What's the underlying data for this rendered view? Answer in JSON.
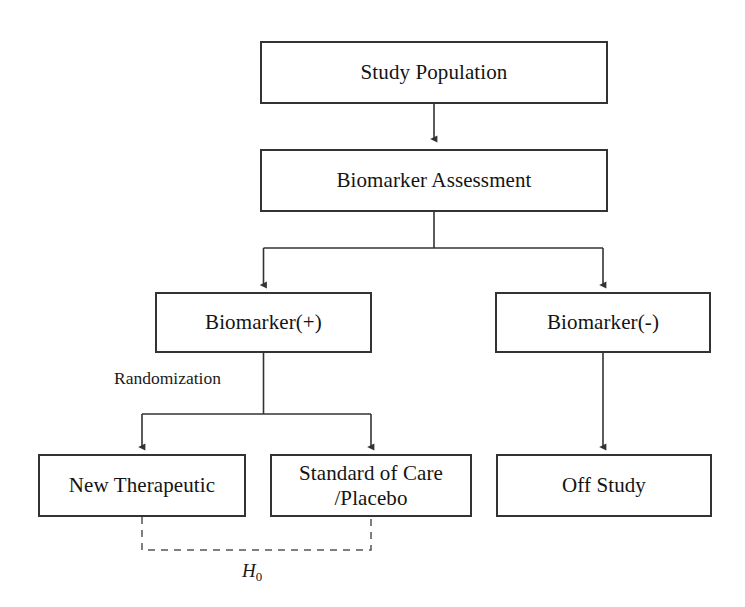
{
  "diagram": {
    "stroke_color": "#333333",
    "background_color": "#ffffff",
    "nodes": [
      {
        "id": "study-population",
        "label": "Study Population",
        "label_line2": ""
      },
      {
        "id": "biomarker-assessment",
        "label": "Biomarker Assessment",
        "label_line2": ""
      },
      {
        "id": "biomarker-positive",
        "label": "Biomarker(+)",
        "label_line2": ""
      },
      {
        "id": "biomarker-negative",
        "label": "Biomarker(-)",
        "label_line2": ""
      },
      {
        "id": "new-therapeutic",
        "label": "New Therapeutic",
        "label_line2": ""
      },
      {
        "id": "standard-of-care",
        "label": "Standard of Care",
        "label_line2": "/Placebo"
      },
      {
        "id": "off-study",
        "label": "Off Study",
        "label_line2": ""
      }
    ],
    "edge_labels": [
      {
        "id": "randomization",
        "text": "Randomization"
      }
    ],
    "annotations": [
      {
        "id": "null-hypothesis",
        "symbol": "H",
        "subscript": "0",
        "style": "dashed-bracket"
      }
    ]
  }
}
